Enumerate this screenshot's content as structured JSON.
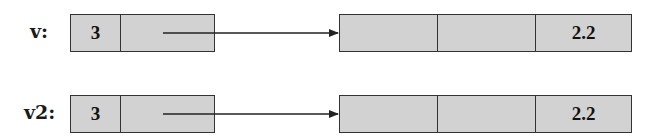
{
  "diagram": {
    "colors": {
      "cell_fill": "#d2d2d2",
      "border": "#333333",
      "text": "#111111",
      "background": "#ffffff"
    },
    "rows": [
      {
        "name": "v",
        "label": "v:",
        "handle": {
          "size": "3",
          "pointer": ""
        },
        "elements": [
          "",
          "",
          "2.2"
        ]
      },
      {
        "name": "v2",
        "label": "v2:",
        "handle": {
          "size": "3",
          "pointer": ""
        },
        "elements": [
          "",
          "",
          "2.2"
        ]
      }
    ]
  }
}
